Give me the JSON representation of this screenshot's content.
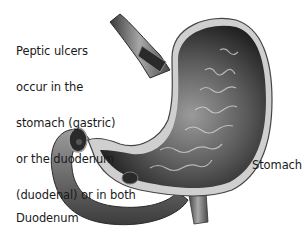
{
  "diagram": {
    "description_lines": [
      "Peptic ulcers",
      "occur in the",
      "stomach (gastric)",
      "or the duodenum",
      "(duodenal) or in both"
    ],
    "labels": {
      "stomach": "Stomach",
      "duodenum": "Duodenum"
    },
    "parts": [
      "esophagus",
      "stomach",
      "duodenum",
      "gastric-ulcer",
      "duodenal-ulcer"
    ],
    "colors": {
      "background": "#ffffff",
      "text": "#1a1a1a",
      "tissue_dark": "#1e1e1e",
      "tissue_mid": "#7a7a7a",
      "tissue_light": "#d0d0d0"
    }
  }
}
